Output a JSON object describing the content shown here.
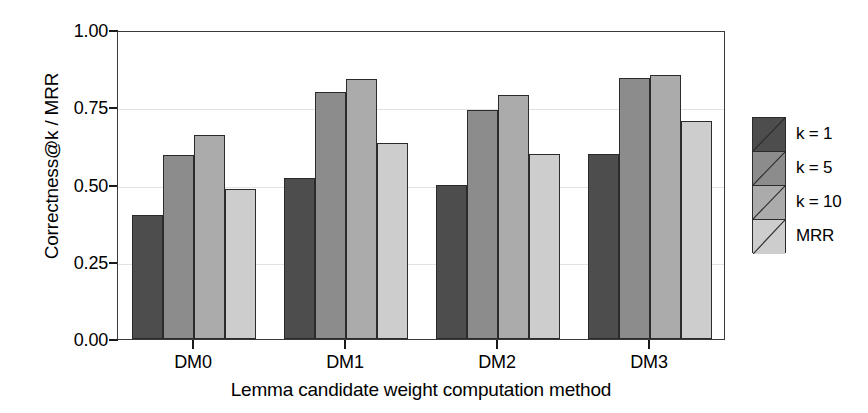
{
  "chart_data": {
    "type": "bar",
    "title": "",
    "xlabel": "Lemma candidate weight computation method",
    "ylabel": "Correctness@k / MRR",
    "categories": [
      "DM0",
      "DM1",
      "DM2",
      "DM3"
    ],
    "series": [
      {
        "name": "k = 1",
        "color": "#4d4d4d",
        "values": [
          0.4,
          0.52,
          0.5,
          0.6
        ]
      },
      {
        "name": "k = 5",
        "color": "#8c8c8c",
        "values": [
          0.595,
          0.8,
          0.74,
          0.845
        ]
      },
      {
        "name": "k = 10",
        "color": "#ababab",
        "values": [
          0.66,
          0.84,
          0.79,
          0.855
        ]
      },
      {
        "name": "MRR",
        "color": "#cdcdcd",
        "values": [
          0.485,
          0.635,
          0.6,
          0.705
        ]
      }
    ],
    "ylim": [
      0.0,
      1.0
    ],
    "yticks": [
      0.0,
      0.25,
      0.5,
      0.75,
      1.0
    ],
    "ytick_labels": [
      "0.00",
      "0.25",
      "0.50",
      "0.75",
      "1.00"
    ],
    "grid": true,
    "legend_position": "right",
    "bar_edge_color": "#2b2b2b",
    "axis_color": "#3a3a3a",
    "grid_color": "#e2e2e2",
    "background": "#ffffff"
  },
  "legend": {
    "entries": [
      {
        "label": "k = 1"
      },
      {
        "label": "k = 5"
      },
      {
        "label": "k = 10"
      },
      {
        "label": "MRR"
      }
    ]
  }
}
